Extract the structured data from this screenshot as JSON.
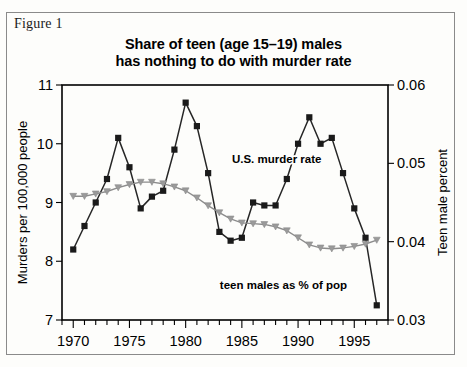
{
  "figure": {
    "caption": "Figure 1"
  },
  "chart_data": {
    "type": "line",
    "title": "Share of teen (age 15–19) males has nothing to do with murder rate",
    "title_lines": [
      "Share of teen (age 15–19) males",
      "has nothing to do with murder rate"
    ],
    "xlabel": "",
    "ylabel": "Murders per 100,000 people",
    "y2label": "Teen male percent",
    "xlim": [
      1969,
      1998
    ],
    "ylim": [
      7,
      11
    ],
    "y2lim": [
      0.03,
      0.06
    ],
    "yticks": [
      7,
      8,
      9,
      10,
      11
    ],
    "ytick_labels": [
      "7",
      "8",
      "9",
      "10",
      "11"
    ],
    "y2ticks": [
      0.03,
      0.04,
      0.05,
      0.06
    ],
    "y2tick_labels": [
      "0.03",
      "0.04",
      "0.05",
      "0.06"
    ],
    "xticks": [
      1970,
      1975,
      1980,
      1985,
      1990,
      1995
    ],
    "xtick_labels": [
      "1970",
      "1975",
      "1980",
      "1985",
      "1990",
      "1995"
    ],
    "xtick_minor_step": 1,
    "grid": false,
    "legend_position": "inline-annotation",
    "x": [
      1970,
      1971,
      1972,
      1973,
      1974,
      1975,
      1976,
      1977,
      1978,
      1979,
      1980,
      1981,
      1982,
      1983,
      1984,
      1985,
      1986,
      1987,
      1988,
      1989,
      1990,
      1991,
      1992,
      1993,
      1994,
      1995,
      1996,
      1997
    ],
    "series": [
      {
        "name": "U.S. murder rate",
        "axis": "left",
        "color": "#1a1a1a",
        "marker": "square",
        "label_text": "U.S. murder rate",
        "label_x": 1988.1,
        "label_y": 9.68,
        "values": [
          8.2,
          8.6,
          9.0,
          9.4,
          10.1,
          9.6,
          8.9,
          9.1,
          9.2,
          9.9,
          10.7,
          10.3,
          9.5,
          8.5,
          8.35,
          8.4,
          9.0,
          8.95,
          8.95,
          9.4,
          10.0,
          10.45,
          10.0,
          10.1,
          9.5,
          8.9,
          8.4,
          7.25
        ]
      },
      {
        "name": "teen males as % of pop",
        "axis": "right",
        "color": "#9a9a9a",
        "marker": "triangle-down",
        "label_text": "teen males as % of pop",
        "label_x": 1988.7,
        "label_y_right": 0.0339,
        "values": [
          0.0458,
          0.0458,
          0.0461,
          0.0464,
          0.0469,
          0.0473,
          0.0476,
          0.0476,
          0.0474,
          0.047,
          0.0465,
          0.0456,
          0.0446,
          0.0437,
          0.0429,
          0.0424,
          0.0423,
          0.0422,
          0.0419,
          0.0414,
          0.0405,
          0.0396,
          0.0392,
          0.0391,
          0.0392,
          0.0394,
          0.0397,
          0.0402
        ]
      }
    ]
  }
}
